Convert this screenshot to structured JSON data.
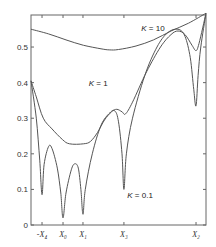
{
  "chart_data": {
    "type": "line",
    "title": "",
    "xlabel": "",
    "ylabel": "",
    "ylim": [
      0,
      0.59
    ],
    "grid": false,
    "legend": "none (inline curve annotations)",
    "y_ticks": [
      {
        "value": 0,
        "label": "0"
      },
      {
        "value": 0.1,
        "label": "0.1"
      },
      {
        "value": 0.2,
        "label": "0.2"
      },
      {
        "value": 0.3,
        "label": "0.3"
      },
      {
        "value": 0.4,
        "label": "0.4"
      },
      {
        "value": 0.5,
        "label": "0.5"
      }
    ],
    "x_ticks": [
      {
        "pos": 0.063,
        "label": "-X₄"
      },
      {
        "pos": 0.183,
        "label": "X₀"
      },
      {
        "pos": 0.297,
        "label": "X₁"
      },
      {
        "pos": 0.531,
        "label": "X₃"
      },
      {
        "pos": 0.943,
        "label": "X₂"
      }
    ],
    "x_range": [
      0,
      1
    ],
    "series": [
      {
        "name": "K = 10",
        "label_pos": {
          "x": 0.63,
          "y": 0.545
        },
        "points": [
          [
            0.0,
            0.55
          ],
          [
            0.1,
            0.537
          ],
          [
            0.2,
            0.52
          ],
          [
            0.3,
            0.505
          ],
          [
            0.4,
            0.495
          ],
          [
            0.45,
            0.492
          ],
          [
            0.5,
            0.493
          ],
          [
            0.6,
            0.503
          ],
          [
            0.7,
            0.52
          ],
          [
            0.8,
            0.545
          ],
          [
            0.9,
            0.567
          ],
          [
            1.0,
            0.595
          ]
        ]
      },
      {
        "name": "K = 1",
        "label_pos": {
          "x": 0.33,
          "y": 0.39
        },
        "points": [
          [
            0.0,
            0.405
          ],
          [
            0.03,
            0.36
          ],
          [
            0.07,
            0.3
          ],
          [
            0.12,
            0.27
          ],
          [
            0.18,
            0.24
          ],
          [
            0.22,
            0.228
          ],
          [
            0.3,
            0.228
          ],
          [
            0.34,
            0.235
          ],
          [
            0.38,
            0.26
          ],
          [
            0.42,
            0.295
          ],
          [
            0.46,
            0.318
          ],
          [
            0.49,
            0.325
          ],
          [
            0.52,
            0.318
          ],
          [
            0.54,
            0.312
          ],
          [
            0.58,
            0.345
          ],
          [
            0.66,
            0.43
          ],
          [
            0.74,
            0.5
          ],
          [
            0.8,
            0.535
          ],
          [
            0.84,
            0.545
          ],
          [
            0.88,
            0.535
          ],
          [
            0.92,
            0.505
          ],
          [
            0.943,
            0.49
          ],
          [
            0.96,
            0.51
          ],
          [
            1.0,
            0.595
          ]
        ]
      },
      {
        "name": "K = 0.1",
        "label_pos": {
          "x": 0.55,
          "y": 0.075
        },
        "points": [
          [
            0.0,
            0.405
          ],
          [
            0.03,
            0.3
          ],
          [
            0.05,
            0.18
          ],
          [
            0.063,
            0.085
          ],
          [
            0.075,
            0.17
          ],
          [
            0.1,
            0.22
          ],
          [
            0.12,
            0.215
          ],
          [
            0.15,
            0.16
          ],
          [
            0.17,
            0.09
          ],
          [
            0.183,
            0.02
          ],
          [
            0.2,
            0.09
          ],
          [
            0.23,
            0.155
          ],
          [
            0.25,
            0.172
          ],
          [
            0.27,
            0.16
          ],
          [
            0.285,
            0.1
          ],
          [
            0.297,
            0.03
          ],
          [
            0.31,
            0.1
          ],
          [
            0.35,
            0.2
          ],
          [
            0.4,
            0.28
          ],
          [
            0.45,
            0.315
          ],
          [
            0.48,
            0.32
          ],
          [
            0.5,
            0.29
          ],
          [
            0.52,
            0.2
          ],
          [
            0.531,
            0.1
          ],
          [
            0.545,
            0.2
          ],
          [
            0.58,
            0.3
          ],
          [
            0.65,
            0.42
          ],
          [
            0.72,
            0.5
          ],
          [
            0.78,
            0.54
          ],
          [
            0.84,
            0.55
          ],
          [
            0.88,
            0.53
          ],
          [
            0.91,
            0.47
          ],
          [
            0.93,
            0.38
          ],
          [
            0.943,
            0.335
          ],
          [
            0.955,
            0.42
          ],
          [
            0.97,
            0.5
          ],
          [
            1.0,
            0.595
          ]
        ]
      }
    ]
  },
  "annotations": {
    "k10": "K = 10",
    "k1": "K = 1",
    "k01": "K = 0.1"
  }
}
